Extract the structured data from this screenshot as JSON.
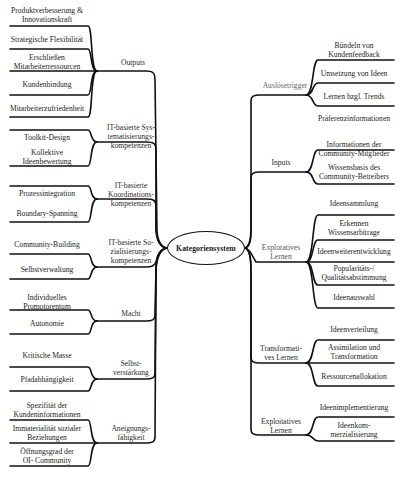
{
  "center": {
    "label": "Kategoriensystem"
  },
  "left": [
    {
      "label": "Outputs",
      "leaves": [
        "Produktverbesserung &\nInnovationskraft",
        "Strategische Flexibilität",
        "Erschließen\nMitarbeiterressourcen",
        "Kundenbindung",
        "Mitarbeiterzufriedenheit"
      ]
    },
    {
      "label": "IT-basierte Sys-\ntematisierungs-\nkompetenzen",
      "leaves": [
        "Toolkit-Design",
        "Kollektive\nIdeenbewertung"
      ]
    },
    {
      "label": "IT-basierte\nKoordinations-\nkompetenzen",
      "leaves": [
        "Prozessintegration",
        "Boundary-Spanning"
      ]
    },
    {
      "label": "IT-basierte So-\nzialisierungs-\nkompetenzen",
      "leaves": [
        "Community-Building",
        "Selbstverwaltung"
      ]
    },
    {
      "label": "Macht",
      "leaves": [
        "Individuelles\nPromotorentum",
        "Autonomie"
      ]
    },
    {
      "label": "Selbst-\nverstärkung",
      "leaves": [
        "Kritische Masse",
        "Pfadabhängigkeit"
      ]
    },
    {
      "label": "Aneignungs-\nfähigkeit",
      "leaves": [
        "Spezifität der\nKundeninformationen",
        "Immaterialität sozialer\nBeziehungen",
        "Öffnungsgrad der\nOI- Community"
      ]
    }
  ],
  "right": [
    {
      "label": "Auslösetrigger",
      "leaves": [
        "Bündeln von\nKundenfeedback",
        "Umsetzung von Ideen",
        "Lernen bzgl. Trends",
        "Präferenzinformationen"
      ]
    },
    {
      "label": "Inputs",
      "leaves": [
        "Informationen der\nCommunity-Mitglieder",
        "Wissensbasis des\nCommunity-Betreibers"
      ]
    },
    {
      "label": "Exploratives\nLernen",
      "leaves": [
        "Ideensammlung",
        "Erkennen\nWissensarbitrage",
        "Ideenweiterentwicklung",
        "Popularitäts-/\nQualitätsabstimmung",
        "Ideenauswahl"
      ]
    },
    {
      "label": "Transformati-\nves Lernen",
      "leaves": [
        "Ideenverteilung",
        "Assimilation und\nTransformation",
        "Ressourcenallokation"
      ]
    },
    {
      "label": "Exploitatives\nLernen",
      "leaves": [
        "Ideenimplementierung",
        "Ideenkom-\nmerzialisierung"
      ]
    }
  ]
}
